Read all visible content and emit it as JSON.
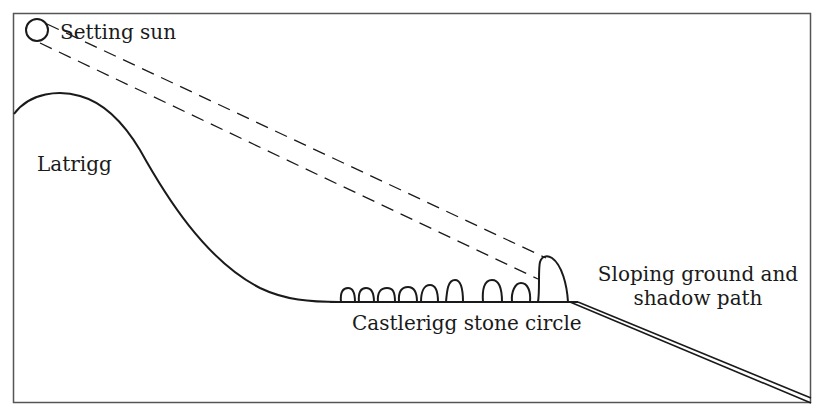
{
  "diagram": {
    "title": "",
    "labels": {
      "sun": "Setting sun",
      "hill": "Latrigg",
      "stone_circle": "Castlerigg stone circle",
      "ground_line1": "Sloping ground and",
      "ground_line2": "shadow path"
    },
    "elements": [
      {
        "id": "sun",
        "type": "circle",
        "label": "Setting sun"
      },
      {
        "id": "hill",
        "type": "curve",
        "label": "Latrigg"
      },
      {
        "id": "sight-lines",
        "type": "dashed-lines",
        "count": 2
      },
      {
        "id": "stones",
        "type": "stone-row",
        "count": 10,
        "label": "Castlerigg stone circle"
      },
      {
        "id": "slope",
        "type": "double-line",
        "label": "Sloping ground and shadow path"
      }
    ],
    "colors": {
      "line": "#1a1a1a",
      "frame": "#555555",
      "background": "#ffffff"
    }
  }
}
